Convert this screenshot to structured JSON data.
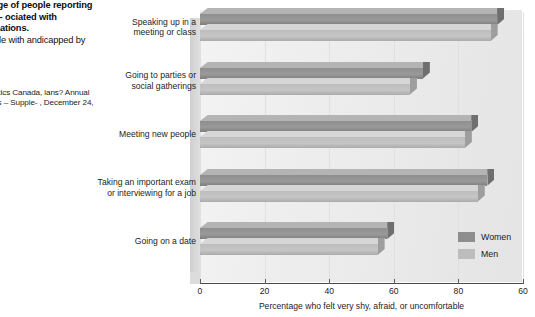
{
  "caption": {
    "heading": "ntage of people\nreporting spe-\nociated with\nsituations.",
    "subtext": "eople with\nandicapped by",
    "source": "tatistics Canada,\nians? Annual\nports – Supple-\n, December 24,"
  },
  "legend": {
    "position": "bottom-right",
    "items": [
      {
        "label": "Women",
        "color": "#8e8e8e"
      },
      {
        "label": "Men",
        "color": "#bdbdbd"
      }
    ]
  },
  "chart_data": {
    "type": "bar",
    "orientation": "horizontal",
    "title": "",
    "xlabel": "Percentage who felt very shy, afraid, or uncomfortable",
    "ylabel": "",
    "xlim": [
      0,
      100
    ],
    "xticks": [
      0,
      20,
      40,
      60,
      80,
      100
    ],
    "xticklabels": [
      "0",
      "20",
      "40",
      "60",
      "80",
      "60"
    ],
    "grid": true,
    "categories": [
      "Speaking up in a\nmeeting or class",
      "Going to parties or\nsocial gatherings",
      "Meeting new people",
      "Taking an important exam\nor interviewing for a job",
      "Going on a date"
    ],
    "series": [
      {
        "name": "Women",
        "color": "#8e8e8e",
        "values": [
          92,
          69,
          84,
          89,
          58
        ]
      },
      {
        "name": "Men",
        "color": "#bdbdbd",
        "values": [
          90,
          65,
          82,
          86,
          55
        ]
      }
    ]
  }
}
